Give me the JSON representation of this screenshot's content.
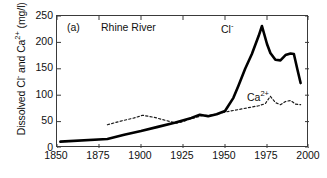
{
  "figure": {
    "panel_label": "(a)",
    "title": "Rhine River",
    "ylabel_text": "Dissolved Cl",
    "ylabel_sup1": "-",
    "ylabel_mid": " and Ca",
    "ylabel_sup2": "2+",
    "ylabel_units": " (mg/l)",
    "series_label_cl": "Cl",
    "series_label_cl_sup": "-",
    "series_label_ca": "Ca",
    "series_label_ca_sup": "2+"
  },
  "axes": {
    "x_ticks": [
      "1850",
      "1875",
      "1900",
      "1925",
      "1950",
      "1975",
      "2000"
    ],
    "y_ticks": [
      "250",
      "200",
      "150",
      "100",
      "50",
      "0"
    ],
    "x_min": 1850,
    "x_max": 2000,
    "y_min": 0,
    "y_max": 250,
    "frame_color": "#3a3a3a"
  },
  "chart_data": {
    "type": "line",
    "title": "Rhine River",
    "panel": "(a)",
    "xlabel": "",
    "ylabel": "Dissolved Cl- and Ca2+ (mg/l)",
    "xlim": [
      1850,
      2000
    ],
    "ylim": [
      0,
      250
    ],
    "xticks": [
      1850,
      1875,
      1900,
      1925,
      1950,
      1975,
      2000
    ],
    "yticks": [
      0,
      50,
      100,
      150,
      200,
      250
    ],
    "grid": false,
    "legend": "inline-annotations",
    "series": [
      {
        "name": "Cl-",
        "style": "solid",
        "linewidth": 2.6,
        "color": "#000000",
        "x": [
          1852,
          1880,
          1890,
          1900,
          1910,
          1920,
          1930,
          1935,
          1940,
          1945,
          1950,
          1955,
          1958,
          1962,
          1966,
          1970,
          1972,
          1975,
          1977,
          1980,
          1983,
          1986,
          1989,
          1991,
          1993,
          1995
        ],
        "y": [
          12,
          17,
          25,
          32,
          40,
          48,
          57,
          63,
          60,
          64,
          70,
          95,
          118,
          150,
          178,
          212,
          231,
          197,
          180,
          167,
          166,
          176,
          179,
          178,
          150,
          123
        ]
      },
      {
        "name": "Ca2+",
        "style": "dotted",
        "linewidth": 1.2,
        "color": "#1a1a1a",
        "x": [
          1880,
          1888,
          1896,
          1901,
          1908,
          1915,
          1921,
          1925,
          1929,
          1933,
          1937,
          1941,
          1945,
          1950,
          1955,
          1960,
          1965,
          1970,
          1974,
          1977,
          1980,
          1983,
          1986,
          1989,
          1992,
          1995
        ],
        "y": [
          44,
          51,
          57,
          62,
          58,
          52,
          47,
          50,
          55,
          58,
          62,
          62,
          64,
          68,
          71,
          74,
          77,
          80,
          84,
          98,
          86,
          82,
          88,
          90,
          83,
          82
        ]
      }
    ]
  }
}
